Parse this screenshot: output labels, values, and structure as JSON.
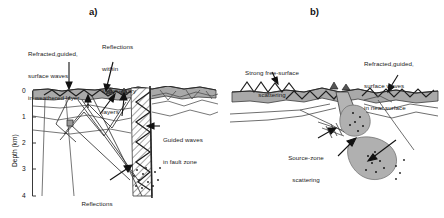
{
  "figure": {
    "type": "two-panel geological cross-section diagram",
    "panels": [
      {
        "id": "a)",
        "name": "strike-slip fault zone cross-section",
        "axis": {
          "title": "Depth (km)",
          "ticks": [
            "0",
            "1",
            "2",
            "3",
            "4"
          ],
          "min": 0,
          "max": 4,
          "unit": "km"
        },
        "annotations": [
          {
            "name": "weathered-layer-label",
            "lines": [
              "Refracted,guided,",
              "surface waves",
              "in weathered layer"
            ]
          },
          {
            "name": "sedimentary-reflections-label",
            "lines": [
              "Reflections",
              "within",
              "sedimentary",
              "layers"
            ]
          },
          {
            "name": "guided-waves-label",
            "lines": [
              "Guided waves",
              "in fault zone"
            ]
          },
          {
            "name": "deep-crust-reflections-label",
            "lines": [
              "Reflections",
              "from deep crust"
            ]
          }
        ]
      },
      {
        "id": "b)",
        "name": "source-zone scattering cross-section",
        "annotations": [
          {
            "name": "free-surface-scattering-label",
            "lines": [
              "Strong free-surface",
              "scattering"
            ]
          },
          {
            "name": "near-surface-waves-label",
            "lines": [
              "Refracted,guided,",
              "surface waves",
              "in near surface"
            ]
          },
          {
            "name": "source-zone-scattering-label",
            "lines": [
              "Source-zone",
              "scattering"
            ]
          }
        ]
      }
    ],
    "colors": {
      "surface_layer": "#a8a8a8",
      "blob_fill": "#b0b0b0",
      "line": "#333333",
      "hatch": "#555555",
      "background": "#ffffff"
    }
  }
}
